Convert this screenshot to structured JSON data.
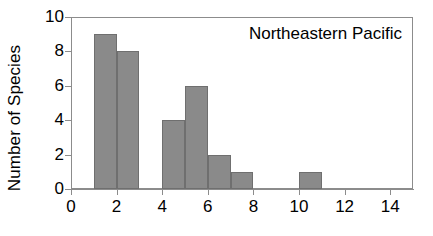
{
  "chart_data": {
    "type": "bar",
    "title": "Northeastern Pacific",
    "xlabel": "",
    "ylabel": "Number of Species",
    "xlim": [
      0,
      15
    ],
    "ylim": [
      0,
      10
    ],
    "grid": false,
    "legend": null,
    "bar_style": {
      "fill": "#8a8a8a",
      "edge": "#6f6f6f",
      "bin_width": 1
    },
    "axis_color": "#8c8c8c",
    "text_color": "#000000",
    "background": "#ffffff",
    "xticks": [
      0,
      2,
      4,
      6,
      8,
      10,
      12,
      14
    ],
    "xtick_labels": [
      "0",
      "2",
      "4",
      "6",
      "8",
      "10",
      "12",
      "14"
    ],
    "yticks": [
      0,
      2,
      4,
      6,
      8,
      10
    ],
    "ytick_labels": [
      "0",
      "2",
      "4",
      "6",
      "8",
      "10"
    ],
    "bin_edges": [
      0,
      1,
      2,
      3,
      4,
      5,
      6,
      7,
      8,
      9,
      10,
      11,
      12,
      13,
      14,
      15
    ],
    "categories": [
      "0-1",
      "1-2",
      "2-3",
      "3-4",
      "4-5",
      "5-6",
      "6-7",
      "7-8",
      "8-9",
      "9-10",
      "10-11",
      "11-12",
      "12-13",
      "13-14",
      "14-15"
    ],
    "values": [
      0,
      9,
      8,
      0,
      4,
      6,
      2,
      1,
      0,
      0,
      1,
      0,
      0,
      0,
      0
    ],
    "bars": [
      {
        "x0": 1,
        "x1": 2,
        "value": 9
      },
      {
        "x0": 2,
        "x1": 3,
        "value": 8
      },
      {
        "x0": 4,
        "x1": 5,
        "value": 4
      },
      {
        "x0": 5,
        "x1": 6,
        "value": 6
      },
      {
        "x0": 6,
        "x1": 7,
        "value": 2
      },
      {
        "x0": 7,
        "x1": 8,
        "value": 1
      },
      {
        "x0": 10,
        "x1": 11,
        "value": 1
      }
    ]
  }
}
